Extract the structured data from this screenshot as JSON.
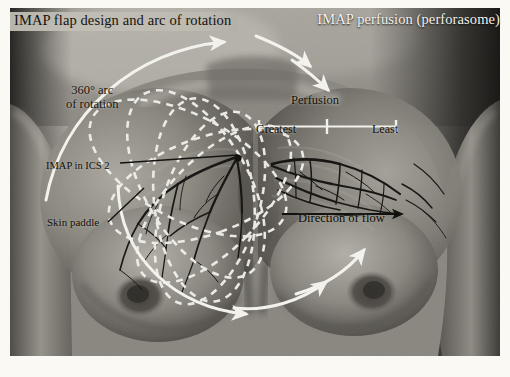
{
  "figure": {
    "panels": {
      "left_title": "IMAP flap design and arc of rotation",
      "right_title": "IMAP perfusion (perforasome)"
    },
    "annotations": {
      "arc_line1": "360° arc",
      "arc_line2": "of rotation",
      "imap_ics": "IMAP in ICS 2",
      "skin_paddle": "Skin paddle",
      "perfusion": "Perfusion",
      "greatest": "Greatest",
      "least": "Least",
      "direction_of_flow": "Direction of flow"
    },
    "colors": {
      "overlay_white": "#f4f3ee",
      "vessel_dark": "#161410",
      "label_dark": "#14120d",
      "plate_background": "#4c4c4c",
      "page_background": "#faf9f4"
    }
  }
}
